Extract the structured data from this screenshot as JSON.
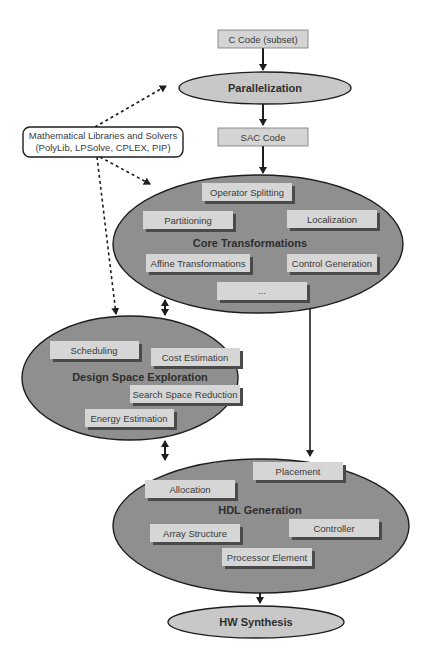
{
  "diagram": {
    "input_box": {
      "label": "C Code (subset)"
    },
    "stage_parallelization": {
      "label": "Parallelization"
    },
    "intermediate_box": {
      "label": "SAC Code"
    },
    "libraries_box": {
      "line1": "Mathematical Libraries and Solvers",
      "line2": "(PolyLib, LPSolve, CPLEX, PIP)"
    },
    "core_transformations": {
      "label": "Core Transformations",
      "items": [
        "Operator Splitting",
        "Partitioning",
        "Localization",
        "Affine Transformations",
        "Control Generation",
        "..."
      ]
    },
    "design_space_exploration": {
      "label": "Design Space Exploration",
      "items": [
        "Scheduling",
        "Cost Estimation",
        "Search Space Reduction",
        "Energy Estimation"
      ]
    },
    "hdl_generation": {
      "label": "HDL Generation",
      "items": [
        "Placement",
        "Allocation",
        "Controller",
        "Array Structure",
        "Processor Element"
      ]
    },
    "output_stage": {
      "label": "HW Synthesis"
    },
    "colors": {
      "big_ellipse_fill": "#8f8f8f",
      "small_ellipse_fill": "#c8c8c8",
      "box_fill": "#d6d6d6",
      "box_shadow": "#4a4a4a",
      "stroke": "#1e1e1e"
    }
  }
}
